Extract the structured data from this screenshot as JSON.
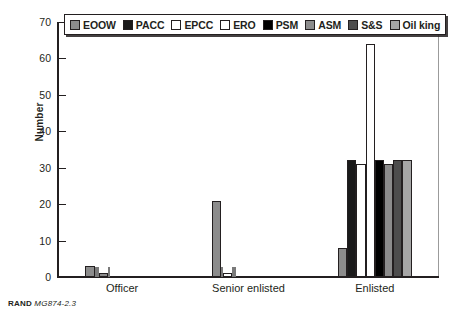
{
  "figure": {
    "footer_org": "RAND",
    "footer_docid": "MG874-2.3"
  },
  "chart_data": {
    "type": "bar",
    "title": "",
    "xlabel": "",
    "ylabel": "Number",
    "ylim": [
      0,
      70
    ],
    "yticks": [
      0,
      10,
      20,
      30,
      40,
      50,
      60,
      70
    ],
    "ytick_labels": [
      "0",
      "10",
      "20",
      "30",
      "40",
      "50",
      "60",
      "70"
    ],
    "grid": false,
    "legend_position": "top",
    "categories": [
      "Officer",
      "Senior enlisted",
      "Enlisted"
    ],
    "series": [
      {
        "name": "EOOW",
        "color": "#8c8c8c",
        "values": [
          3,
          21,
          8
        ]
      },
      {
        "name": "PACC",
        "color": "#1a1a1a",
        "values": [
          0,
          0,
          32
        ]
      },
      {
        "name": "EPCC",
        "color": "#ffffff",
        "values": [
          0,
          0,
          31
        ]
      },
      {
        "name": "ERO",
        "color": "#ffffff",
        "values": [
          0,
          1,
          64
        ]
      },
      {
        "name": "PSM",
        "color": "#000000",
        "values": [
          0,
          0,
          32
        ]
      },
      {
        "name": "ASM",
        "color": "#8c8c8c",
        "values": [
          1,
          0,
          31
        ]
      },
      {
        "name": "S&S",
        "color": "#4d4d4d",
        "values": [
          0,
          0,
          32
        ]
      },
      {
        "name": "Oil king",
        "color": "#a6a6a6",
        "values": [
          0,
          0,
          32
        ]
      }
    ]
  }
}
